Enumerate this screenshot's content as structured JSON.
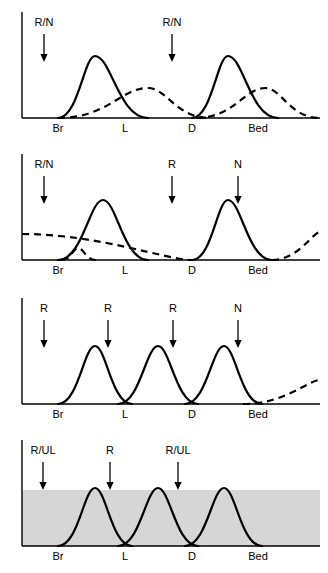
{
  "figure": {
    "title": "",
    "panel_count": 4,
    "axis": {
      "tick_labels": [
        "Br",
        "L",
        "D",
        "Bed"
      ],
      "tick_x": [
        58,
        125,
        192,
        258
      ],
      "baseline_y": 118,
      "y_axis_x": 22,
      "x_start": 22,
      "x_end": 320
    }
  },
  "chart_data": {
    "type": "line",
    "title": "",
    "xlabel": "",
    "ylabel": "",
    "grid": false,
    "legend": null,
    "x_categories": [
      "Br",
      "L",
      "D",
      "Bed"
    ],
    "x_positions": [
      58,
      125,
      192,
      258
    ],
    "panels": [
      {
        "id": "panel-1",
        "name": "panel-1",
        "shaded_band": false,
        "arrows": [
          {
            "label": "R/N",
            "x": 44
          },
          {
            "label": "R/N",
            "x": 172
          }
        ],
        "solid_curves": [
          {
            "start_x": 58,
            "peak_x": 95,
            "end_x": 148,
            "peak_height": 62
          },
          {
            "start_x": 192,
            "peak_x": 228,
            "end_x": 278,
            "peak_height": 62
          }
        ],
        "dashed_curves": [
          {
            "start_x": 58,
            "peak_x": 148,
            "end_x": 210,
            "peak_height": 30
          },
          {
            "start_x": 196,
            "peak_x": 265,
            "end_x": 320,
            "peak_height": 30
          }
        ]
      },
      {
        "id": "panel-2",
        "name": "panel-2",
        "shaded_band": false,
        "arrows": [
          {
            "label": "R/N",
            "x": 44
          },
          {
            "label": "R",
            "x": 172
          },
          {
            "label": "N",
            "x": 238
          }
        ],
        "solid_curves": [
          {
            "start_x": 58,
            "peak_x": 103,
            "end_x": 148,
            "peak_height": 60
          },
          {
            "start_x": 192,
            "peak_x": 228,
            "end_x": 272,
            "peak_height": 60
          }
        ],
        "dashed_curves": [
          {
            "start_x": 22,
            "peak_x": 22,
            "end_x": 192,
            "peak_height": 26
          },
          {
            "start_x": 62,
            "peak_x": 78,
            "end_x": 96,
            "peak_height": 12
          },
          {
            "start_x": 272,
            "peak_x": 320,
            "end_x": 320,
            "peak_height": 28
          }
        ]
      },
      {
        "id": "panel-3",
        "name": "panel-3",
        "shaded_band": false,
        "arrows": [
          {
            "label": "R",
            "x": 44
          },
          {
            "label": "R",
            "x": 108
          },
          {
            "label": "R",
            "x": 173
          },
          {
            "label": "N",
            "x": 238
          }
        ],
        "solid_curves": [
          {
            "start_x": 58,
            "peak_x": 95,
            "end_x": 132,
            "peak_height": 58
          },
          {
            "start_x": 118,
            "peak_x": 158,
            "end_x": 198,
            "peak_height": 58
          },
          {
            "start_x": 185,
            "peak_x": 224,
            "end_x": 262,
            "peak_height": 58
          }
        ],
        "dashed_curves": [
          {
            "start_x": 243,
            "peak_x": 320,
            "end_x": 320,
            "peak_height": 24
          }
        ]
      },
      {
        "id": "panel-4",
        "name": "panel-4",
        "shaded_band": true,
        "band_top_y": 62,
        "band_color": "#d6d6d6",
        "arrows": [
          {
            "label": "R/UL",
            "x": 43
          },
          {
            "label": "R",
            "x": 110
          },
          {
            "label": "R/UL",
            "x": 178
          }
        ],
        "solid_curves": [
          {
            "start_x": 58,
            "peak_x": 95,
            "end_x": 132,
            "peak_height": 58
          },
          {
            "start_x": 118,
            "peak_x": 158,
            "end_x": 198,
            "peak_height": 58
          },
          {
            "start_x": 185,
            "peak_x": 224,
            "end_x": 262,
            "peak_height": 58
          }
        ],
        "dashed_curves": []
      }
    ]
  }
}
